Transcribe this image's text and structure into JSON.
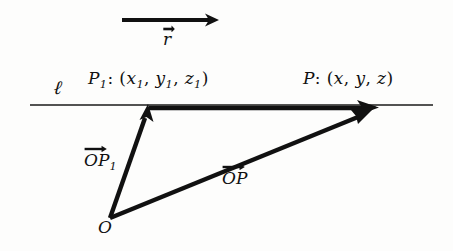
{
  "figure": {
    "background_color": "#fdfdfc",
    "ink_color": "#111111"
  },
  "labels": {
    "line_name": "ℓ",
    "point_p1": {
      "name": "P",
      "subscript": "1",
      "colon": ":",
      "open_paren": "(",
      "coords": [
        "x",
        "y",
        "z"
      ],
      "coord_subscripts": [
        "1",
        "1",
        "1"
      ],
      "comma": ",",
      "close_paren": ")",
      "full_text": "P₁: (x₁, y₁, z₁)"
    },
    "point_p": {
      "name": "P",
      "colon": ":",
      "open_paren": "(",
      "coords": [
        "x",
        "y",
        "z"
      ],
      "comma": ",",
      "close_paren": ")",
      "full_text": "P: (x, y, z)"
    },
    "vector_op1": {
      "name": "OP",
      "subscript": "1",
      "full_text": "OP₁",
      "has_over_arrow": true
    },
    "vector_op": {
      "name": "OP",
      "full_text": "OP",
      "has_over_arrow": true
    },
    "vector_r": {
      "name": "r",
      "full_text": "r",
      "has_over_arrow": true
    },
    "origin": {
      "name": "O"
    }
  },
  "geometry": {
    "line_ell": {
      "x1": 30,
      "y1": 105,
      "x2": 433,
      "y2": 105,
      "stroke_width": 1.6
    },
    "segment_p1_to_p": {
      "x1": 149,
      "y1": 108,
      "x2": 372,
      "y2": 108,
      "stroke_width": 4.2
    },
    "vector_op1": {
      "x1": 110,
      "y1": 219,
      "x2": 148,
      "y2": 108,
      "stroke_width": 4.2
    },
    "vector_op": {
      "x1": 110,
      "y1": 219,
      "x2": 372,
      "y2": 111,
      "stroke_width": 4.2
    },
    "direction_arrow_r": {
      "x1": 122,
      "y1": 20,
      "x2": 217,
      "y2": 20,
      "stroke_width": 4.0
    }
  }
}
